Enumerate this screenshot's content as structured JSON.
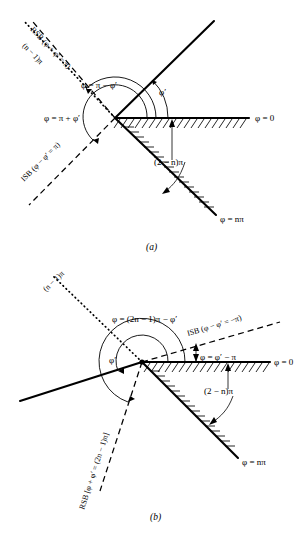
{
  "figure": {
    "background_color": "#ffffff",
    "ink_color": "#000000"
  },
  "panels": [
    {
      "id": "a",
      "caption": "(a)",
      "labels": {
        "rsb": "RSB (φ + φ′ = π)",
        "isb": "ISB (φ − φ′ = π)",
        "dotted_line": "(n − 1)π",
        "phi_pi_minus": "φ = π − φ′",
        "phi_pi_plus": "φ = π + φ′",
        "phi_prime": "φ′",
        "phi_zero": "φ = 0",
        "phi_npi": "φ = nπ",
        "wedge_angle": "(2 − n)π"
      }
    },
    {
      "id": "b",
      "caption": "(b)",
      "labels": {
        "rsb": "RSB [φ + φ′ = (2n − 1)π]",
        "isb": "ISB (φ − φ′ = −π)",
        "dotted_line": "(n − 1)π",
        "phi_2n_minus": "φ = (2n − 1)π − φ′",
        "phi_prime_minus_pi": "φ = φ′ − π",
        "phi_prime": "φ′",
        "phi_zero": "φ = 0",
        "phi_npi": "φ = nπ",
        "wedge_angle": "(2 − n)π"
      }
    }
  ],
  "geometry_notes": {
    "panel_a_vertex": "115,118",
    "panel_b_vertex": "142,97",
    "line_styles": {
      "incident_and_faces": "solid",
      "shadow_boundaries": "dashed",
      "extension_line": "dotted"
    }
  }
}
